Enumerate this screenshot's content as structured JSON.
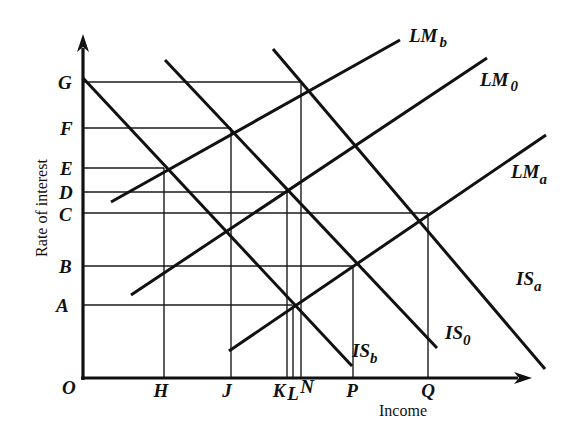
{
  "diagram": {
    "type": "IS-LM diagram",
    "axes": {
      "y_title": "Rate of interest",
      "x_title": "Income",
      "origin_label": "O"
    },
    "y_ticks": [
      {
        "label": "G",
        "y": 82
      },
      {
        "label": "F",
        "y": 128
      },
      {
        "label": "E",
        "y": 168
      },
      {
        "label": "D",
        "y": 192
      },
      {
        "label": "C",
        "y": 213
      },
      {
        "label": "B",
        "y": 266
      },
      {
        "label": "A",
        "y": 305
      }
    ],
    "x_ticks": [
      {
        "label": "H",
        "x": 164
      },
      {
        "label": "J",
        "x": 231
      },
      {
        "label": "K",
        "x": 287
      },
      {
        "label": "L",
        "x": 293
      },
      {
        "label": "N",
        "x": 300
      },
      {
        "label": "P",
        "x": 353
      },
      {
        "label": "Q",
        "x": 428
      }
    ],
    "curves": [
      {
        "id": "IS_b",
        "base": "IS",
        "sub": "b",
        "kind": "IS",
        "x1": 83,
        "y1": 78,
        "x2": 352,
        "y2": 366
      },
      {
        "id": "IS_0",
        "base": "IS",
        "sub": "0",
        "kind": "IS",
        "x1": 165,
        "y1": 60,
        "x2": 437,
        "y2": 348
      },
      {
        "id": "IS_a",
        "base": "IS",
        "sub": "a",
        "kind": "IS",
        "x1": 273,
        "y1": 49,
        "x2": 545,
        "y2": 369
      },
      {
        "id": "LM_b",
        "base": "LM",
        "sub": "b",
        "kind": "LM",
        "x1": 111,
        "y1": 202,
        "x2": 400,
        "y2": 40
      },
      {
        "id": "LM_0",
        "base": "LM",
        "sub": "0",
        "kind": "LM",
        "x1": 131,
        "y1": 295,
        "x2": 487,
        "y2": 58
      },
      {
        "id": "LM_a",
        "base": "LM",
        "sub": "a",
        "kind": "LM",
        "x1": 229,
        "y1": 351,
        "x2": 546,
        "y2": 135
      }
    ],
    "curve_labels": {
      "LM_b": {
        "base": "LM",
        "sub": "b"
      },
      "LM_0": {
        "base": "LM",
        "sub": "0"
      },
      "LM_a": {
        "base": "LM",
        "sub": "a"
      },
      "IS_a": {
        "base": "IS",
        "sub": "a"
      },
      "IS_0": {
        "base": "IS",
        "sub": "0"
      },
      "IS_b": {
        "base": "IS",
        "sub": "b"
      }
    },
    "intersections": [
      {
        "curves": [
          "IS_b",
          "LM_b"
        ],
        "x_label": "H",
        "y_label": "E"
      },
      {
        "curves": [
          "IS_0",
          "LM_b"
        ],
        "x_label": "J",
        "y_label": "F"
      },
      {
        "curves": [
          "IS_a",
          "LM_b"
        ],
        "x_label": "N",
        "y_label": "G"
      },
      {
        "curves": [
          "IS_b",
          "LM_0"
        ],
        "x_label": "J",
        "y_label": "C"
      },
      {
        "curves": [
          "IS_0",
          "LM_0"
        ],
        "x_label": "K",
        "y_label": "D"
      },
      {
        "curves": [
          "IS_b",
          "LM_a"
        ],
        "x_label": "L",
        "y_label": "A"
      },
      {
        "curves": [
          "IS_0",
          "LM_a"
        ],
        "x_label": "P",
        "y_label": "B"
      },
      {
        "curves": [
          "IS_a",
          "LM_a"
        ],
        "x_label": "Q",
        "y_label": "C"
      }
    ]
  }
}
